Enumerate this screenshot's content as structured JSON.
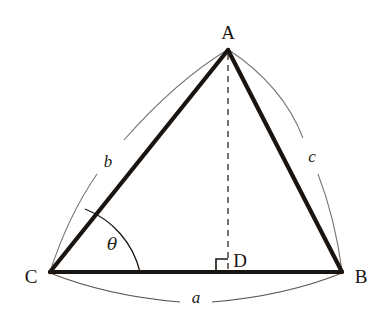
{
  "diagram": {
    "kind": "right-triangle-altitude-geometry",
    "background_color": "#ffffff",
    "stroke_color": "#1a1410",
    "arc_color": "#7a7570",
    "dash_color": "#6b625a",
    "vertices": {
      "A": {
        "label": "A",
        "x": 228,
        "y": 50,
        "label_x": 228,
        "label_y": 32
      },
      "B": {
        "label": "B",
        "x": 342,
        "y": 272,
        "label_x": 361,
        "label_y": 276
      },
      "C": {
        "label": "C",
        "x": 50,
        "y": 272,
        "label_x": 31,
        "label_y": 276
      },
      "D": {
        "label": "D",
        "x": 228,
        "y": 272,
        "label_x": 240,
        "label_y": 260
      }
    },
    "sides": {
      "a": {
        "label": "a",
        "from": "C",
        "to": "B",
        "label_x": 196,
        "label_y": 297
      },
      "b": {
        "label": "b",
        "from": "C",
        "to": "A",
        "label_x": 108,
        "label_y": 161
      },
      "c": {
        "label": "c",
        "from": "A",
        "to": "B",
        "label_x": 312,
        "label_y": 156
      }
    },
    "angles": {
      "theta": {
        "label": "θ",
        "at": "C",
        "label_x": 112,
        "label_y": 244
      },
      "right_angle": {
        "at": "D",
        "marker": "square",
        "size": 12
      }
    },
    "altitude": {
      "from": "A",
      "to": "D",
      "style": "dashed"
    }
  }
}
